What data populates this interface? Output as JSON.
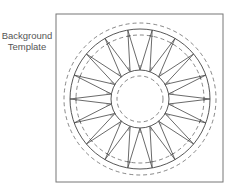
{
  "label": {
    "line1": "Background",
    "line2": "Template"
  },
  "diagram": {
    "type": "quilt-block-template",
    "frame": {
      "x": 56,
      "y": 14,
      "width": 167,
      "height": 168
    },
    "center": {
      "x": 140,
      "y": 99
    },
    "radii": {
      "outer_dashed": 76,
      "outer_solid": 70,
      "ring_dashed": 64,
      "inner_solid": 29,
      "inner_dashed": 23
    },
    "spike_count": 18,
    "spike_start_angle_deg": 0,
    "colors": {
      "stroke": "#555555",
      "frame": "#777777",
      "text": "#555555"
    }
  }
}
